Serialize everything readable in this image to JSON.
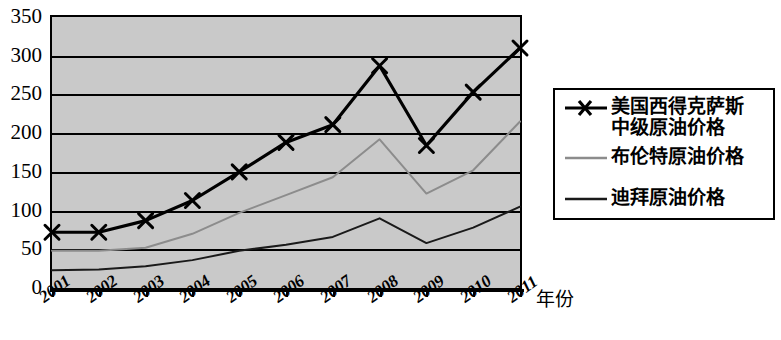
{
  "chart_data": {
    "type": "line",
    "title": "",
    "xlabel": "年份",
    "ylabel": "",
    "categories": [
      "2001",
      "2002",
      "2003",
      "2004",
      "2005",
      "2006",
      "2007",
      "2008",
      "2009",
      "2010",
      "2011"
    ],
    "ylim": [
      0,
      350
    ],
    "ytick_step": 50,
    "yticks": [
      "350",
      "300",
      "250",
      "200",
      "150",
      "100",
      "50",
      "0"
    ],
    "grid": true,
    "legend_position": "right",
    "series": [
      {
        "name": "美国西得克萨斯\n中级原油价格",
        "marker": "x",
        "color": "#000000",
        "width": 3.2,
        "values": [
          72,
          72,
          87,
          113,
          150,
          188,
          211,
          287,
          184,
          253,
          310
        ]
      },
      {
        "name": "布伦特原油价格",
        "marker": "none",
        "color": "#8c8c8c",
        "width": 2,
        "values": [
          48,
          48,
          52,
          70,
          97,
          120,
          143,
          192,
          122,
          152,
          215
        ]
      },
      {
        "name": "迪拜原油价格",
        "marker": "none",
        "color": "#1a1a1a",
        "width": 2,
        "values": [
          23,
          24,
          28,
          36,
          48,
          56,
          66,
          90,
          58,
          78,
          105
        ]
      }
    ]
  },
  "axis": {
    "x_title": "年份",
    "y_tick_labels": [
      "350",
      "300",
      "250",
      "200",
      "150",
      "100",
      "50",
      "0"
    ],
    "x_tick_labels": [
      "2001",
      "2002",
      "2003",
      "2004",
      "2005",
      "2006",
      "2007",
      "2008",
      "2009",
      "2010",
      "2011"
    ]
  },
  "legend": {
    "items": [
      {
        "label": "美国西得克萨斯\n中级原油价格",
        "sample": "line-with-x-marker",
        "color": "#000000"
      },
      {
        "label": "布伦特原油价格",
        "sample": "light-gray-line",
        "color": "#8c8c8c"
      },
      {
        "label": "迪拜原油价格",
        "sample": "dark-line",
        "color": "#1a1a1a"
      }
    ]
  }
}
